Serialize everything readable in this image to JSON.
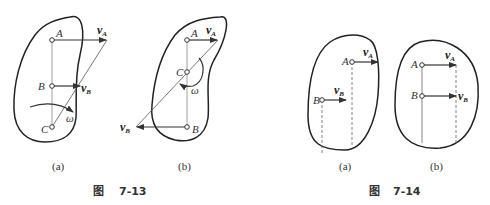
{
  "figures": [
    {
      "caption_prefix": "图",
      "caption_number": "7-13",
      "panels": [
        {
          "sub": "(a)",
          "points": {
            "A": "A",
            "B": "B",
            "C": "C"
          },
          "vectors": {
            "vA": "v",
            "vA_sub": "A",
            "vB": "v",
            "vB_sub": "B"
          },
          "omega": "ω"
        },
        {
          "sub": "(b)",
          "points": {
            "A": "A",
            "B": "B",
            "C": "C"
          },
          "vectors": {
            "vA": "v",
            "vA_sub": "A",
            "vB": "v",
            "vB_sub": "B"
          },
          "omega": "ω"
        }
      ]
    },
    {
      "caption_prefix": "图",
      "caption_number": "7-14",
      "panels": [
        {
          "sub": "(a)",
          "points": {
            "A": "A",
            "B": "B"
          },
          "vectors": {
            "vA": "v",
            "vA_sub": "A",
            "vB": "v",
            "vB_sub": "B"
          }
        },
        {
          "sub": "(b)",
          "points": {
            "A": "A",
            "B": "B"
          },
          "vectors": {
            "vA": "v",
            "vA_sub": "A",
            "vB": "v",
            "vB_sub": "B"
          }
        }
      ]
    }
  ]
}
